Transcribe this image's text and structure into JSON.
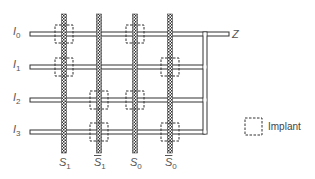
{
  "diagram": {
    "inputs": [
      {
        "name": "I",
        "sub": "0",
        "y": 34
      },
      {
        "name": "I",
        "sub": "1",
        "y": 67
      },
      {
        "name": "I",
        "sub": "2",
        "y": 100
      },
      {
        "name": "I",
        "sub": "3",
        "y": 132
      }
    ],
    "selects": [
      {
        "name": "S",
        "sub": "1",
        "complement": false,
        "x": 64
      },
      {
        "name": "S",
        "sub": "1",
        "complement": true,
        "x": 99
      },
      {
        "name": "S",
        "sub": "0",
        "complement": false,
        "x": 135
      },
      {
        "name": "S",
        "sub": "0",
        "complement": true,
        "x": 170
      }
    ],
    "implants": [
      {
        "input": 0,
        "select": 0
      },
      {
        "input": 0,
        "select": 2
      },
      {
        "input": 1,
        "select": 0
      },
      {
        "input": 1,
        "select": 3
      },
      {
        "input": 2,
        "select": 1
      },
      {
        "input": 2,
        "select": 2
      },
      {
        "input": 3,
        "select": 1
      },
      {
        "input": 3,
        "select": 3
      }
    ],
    "output_label": "Z",
    "legend": {
      "label": "Implant"
    }
  }
}
